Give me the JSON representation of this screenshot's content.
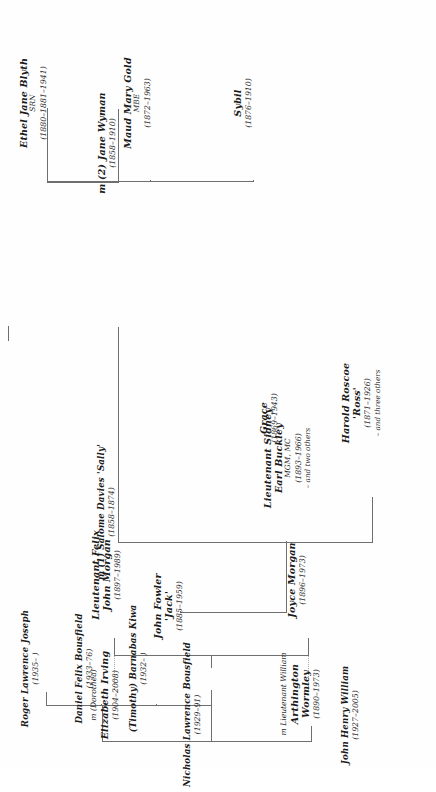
{
  "chart": {
    "type": "family-tree",
    "orientation": "rotated-90-ccw",
    "background": "#fefefe",
    "line_color": "#6f6f6f"
  },
  "nodes": {
    "marriage1": {
      "label": "m (1) Salome Davies 'Sally'",
      "dates": "(1858–1874)"
    },
    "marriage2": {
      "label": "m (2) Jane Wyman",
      "dates": "(1858–1910)"
    },
    "ethel": {
      "name": "Ethel Jane Blyth",
      "sub": "SRN",
      "dates": "(1880–1881–1941)"
    },
    "maud": {
      "name": "Maud Mary Gold",
      "sub": "MBE",
      "dates": "(1872–1963)"
    },
    "sybil": {
      "name": "Sybil",
      "dates": "(1876–1910)"
    },
    "harold": {
      "name": "Harold Roscoe",
      "nickname": "'Ross'",
      "dates": "(1871–1926)",
      "extra": "– and three others"
    },
    "grace": {
      "name": "Grace",
      "dates": "(1869–1943)"
    },
    "john_fowler": {
      "name": "John Fowler",
      "nickname": "'Jack'",
      "dates": "(1885–1959)"
    },
    "sidney": {
      "name": "Lieutenant Sidney",
      "name2": "Earl Buckley",
      "sub": "MGM, MC",
      "dates": "(1893–1966)",
      "extra": "– and two others"
    },
    "felix": {
      "name": "Lieutenant Felix",
      "name2": "John Morgan",
      "dates": "(1897–1989)"
    },
    "dorothea": {
      "marr": "m (Dorothea)",
      "name": "Elizabeth Irving",
      "dates": "(1904–2008)"
    },
    "joyce": {
      "name": "Joyce Morgan",
      "dates": "(1896–1973)"
    },
    "wormley": {
      "marr": "m Lieutenant William",
      "name": "Arthington",
      "name2": "Wormley",
      "dates": "(1890–1973)"
    },
    "john_henry": {
      "name": "John Henry William",
      "dates": "(1927–2005)"
    },
    "nicholas": {
      "name": "Nicholas Lawrence Bousfield",
      "dates": "(1929–91)"
    },
    "timothy": {
      "name": "(Timothy) Barnabas Kiwa",
      "dates": "(1932–  )"
    },
    "daniel": {
      "name": "Daniel Felix Bousfield",
      "dates": "(1933–76)"
    },
    "roger": {
      "name": "Roger Lawrence Joseph",
      "dates": "(1935–  )"
    }
  }
}
